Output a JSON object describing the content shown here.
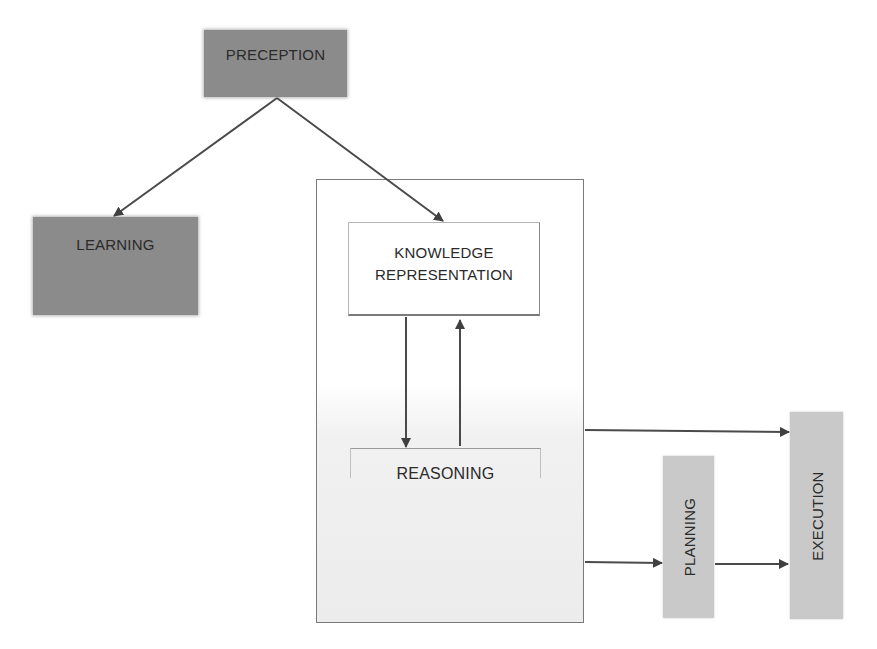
{
  "diagram": {
    "nodes": {
      "perception": {
        "label": "PRECEPTION"
      },
      "learning": {
        "label": "LEARNING"
      },
      "knowledge_representation": {
        "line1": "KNOWLEDGE",
        "line2": "REPRESENTATION"
      },
      "reasoning": {
        "label": "REASONING"
      },
      "planning": {
        "label": "PLANNING"
      },
      "execution": {
        "label": "EXECUTION"
      }
    },
    "edges": [
      {
        "from": "PRECEPTION",
        "to": "LEARNING"
      },
      {
        "from": "PRECEPTION",
        "to": "KNOWLEDGE REPRESENTATION"
      },
      {
        "from": "KNOWLEDGE REPRESENTATION",
        "to": "REASONING"
      },
      {
        "from": "REASONING",
        "to": "KNOWLEDGE REPRESENTATION"
      },
      {
        "from": "KNOWLEDGE REPRESENTATION + REASONING group",
        "to": "EXECUTION"
      },
      {
        "from": "KNOWLEDGE REPRESENTATION + REASONING group",
        "to": "PLANNING"
      },
      {
        "from": "PLANNING",
        "to": "EXECUTION"
      }
    ],
    "colors": {
      "dark_node": "#8b8b8b",
      "light_node": "#c9c9c9",
      "arrow": "#404040",
      "border": "#7a7a7a"
    }
  }
}
